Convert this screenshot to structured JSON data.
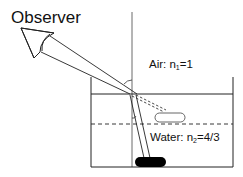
{
  "diagram": {
    "title_label": "Observer",
    "air_label": "Air: n",
    "air_sub": "1",
    "air_value": "=1",
    "water_label": "Water: n",
    "water_sub": "2",
    "water_value": "=4/3",
    "colors": {
      "line": "#222222",
      "object": "#000000",
      "background": "#ffffff"
    }
  }
}
